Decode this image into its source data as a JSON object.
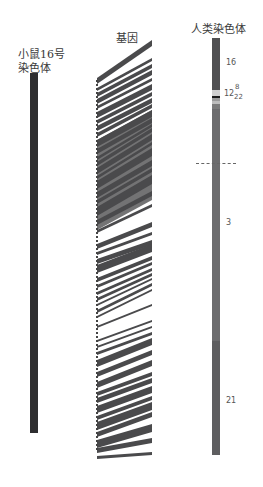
{
  "mouse": {
    "title_line1": "小鼠16号",
    "title_line2": "染色体",
    "color": "#2e2e30"
  },
  "genes": {
    "title": "基因",
    "stripe_color": "#4a4a4c"
  },
  "human": {
    "title": "人类染色体",
    "segments": [
      {
        "label": "16",
        "top": 0,
        "height": 52,
        "color": "#505052"
      },
      {
        "label": "",
        "top": 52,
        "height": 6,
        "color": "#cfcfcf"
      },
      {
        "label": "",
        "top": 58,
        "height": 2,
        "color": "#1a1a1a"
      },
      {
        "label": "12",
        "top": 60,
        "height": 3,
        "color": "#9a9a9a"
      },
      {
        "label": "8",
        "top": 63,
        "height": 3,
        "color": "#bdbdbd"
      },
      {
        "label": "22",
        "top": 66,
        "height": 5,
        "color": "#7b7b7b"
      },
      {
        "label": "3",
        "top": 71,
        "height": 232,
        "color": "#6c6c6e"
      },
      {
        "label": "21",
        "top": 303,
        "height": 114,
        "color": "#5e5e60"
      }
    ],
    "labels": {
      "s16": "16",
      "s12": "12",
      "s8": "8",
      "s22": "22",
      "s3": "3",
      "s21": "21"
    }
  }
}
